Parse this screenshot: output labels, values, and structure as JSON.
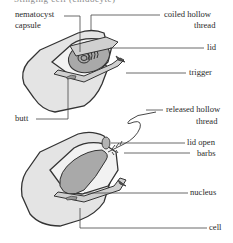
{
  "figure": {
    "title_partial": "Stinging cell (cnidocyte)",
    "top_cell": {
      "labels": {
        "nematocyst_capsule_line1": "nematocyst",
        "nematocyst_capsule_line2": "capsule",
        "coiled_thread_line1": "coiled hollow",
        "coiled_thread_line2": "thread",
        "lid": "lid",
        "trigger": "trigger",
        "butt": "butt"
      }
    },
    "bottom_cell": {
      "labels": {
        "released_thread_line1": "released hollow",
        "released_thread_line2": "thread",
        "lid_open": "lid open",
        "barbs": "barbs",
        "nucleus": "nucleus",
        "cell": "cell"
      }
    },
    "colors": {
      "cell_fill": "#e4e4e4",
      "cell_stroke": "#333333",
      "capsule_fill": "#a9a9a9",
      "inner_fill": "#f2f2f2",
      "leader_line": "#444444"
    }
  }
}
